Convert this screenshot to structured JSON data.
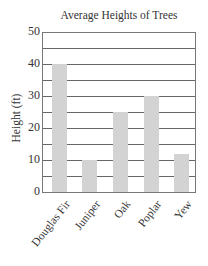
{
  "chart_data": {
    "type": "bar",
    "title": "Average Heights of Trees",
    "xlabel": "",
    "ylabel": "Height (ft)",
    "categories": [
      "Douglas Fir",
      "Juniper",
      "Oak",
      "Poplar",
      "Yew"
    ],
    "values": [
      40,
      10,
      25,
      30,
      12
    ],
    "ylim": [
      0,
      50
    ],
    "yticks": [
      "0",
      "10",
      "20",
      "30",
      "40",
      "50"
    ],
    "grid": true,
    "grid_step": 5,
    "bar_color": "#d3d3d3",
    "legend": null
  }
}
